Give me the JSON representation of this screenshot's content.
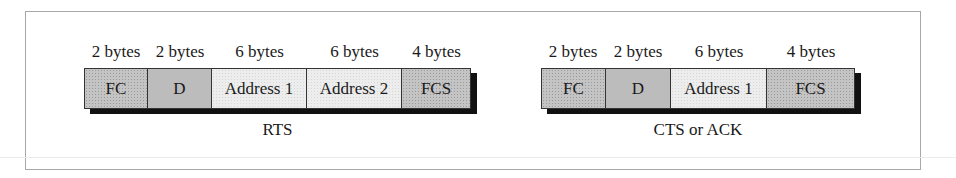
{
  "frames": [
    {
      "name": "RTS",
      "caption": "RTS",
      "fields": [
        {
          "label": "FC",
          "size": "2 bytes",
          "shade": "dark"
        },
        {
          "label": "D",
          "size": "2 bytes",
          "shade": "dark2"
        },
        {
          "label": "Address 1",
          "size": "6 bytes",
          "shade": "light"
        },
        {
          "label": "Address 2",
          "size": "6 bytes",
          "shade": "light"
        },
        {
          "label": "FCS",
          "size": "4 bytes",
          "shade": "dark"
        }
      ]
    },
    {
      "name": "CTS or ACK",
      "caption": "CTS or ACK",
      "fields": [
        {
          "label": "FC",
          "size": "2 bytes",
          "shade": "dark"
        },
        {
          "label": "D",
          "size": "2 bytes",
          "shade": "dark2"
        },
        {
          "label": "Address 1",
          "size": "6 bytes",
          "shade": "light"
        },
        {
          "label": "FCS",
          "size": "4 bytes",
          "shade": "dark"
        }
      ]
    }
  ]
}
